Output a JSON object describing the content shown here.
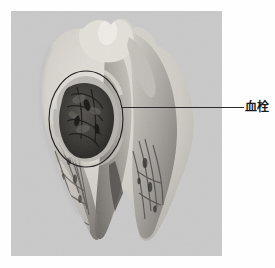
{
  "page": {
    "background_color": "#fefefe",
    "width": 275,
    "height": 268
  },
  "figure": {
    "type": "gross-pathology-photograph",
    "color_mode": "grayscale",
    "plate_background_color": "#c9c9c9",
    "frame": {
      "x": 11,
      "y": 11,
      "width": 211,
      "height": 245
    },
    "tissue_tones": {
      "pale_myocardium": "#d7d4cf",
      "mid_myocardium": "#a9a6a1",
      "dark_myocardium": "#6e6b67",
      "thrombus_dark": "#3a3835",
      "thrombus_darkest": "#232220",
      "highlight": "#ececea"
    }
  },
  "annotations": {
    "circle": {
      "name": "thrombus-circle",
      "shape": "ellipse",
      "stroke_color": "#1e1e1e",
      "stroke_width": 1,
      "center_x": 75,
      "center_y": 108,
      "radius_x": 37,
      "radius_y": 48
    },
    "leader": {
      "name": "leader-line",
      "start_x": 122,
      "start_y": 107,
      "end_x": 244,
      "end_y": 107,
      "color": "#2a2a2a"
    },
    "label": {
      "text": "血栓",
      "meaning": "thrombus",
      "x": 245,
      "y": 100,
      "font_size": 12,
      "color": "#1a1a1a",
      "bold": true
    }
  }
}
